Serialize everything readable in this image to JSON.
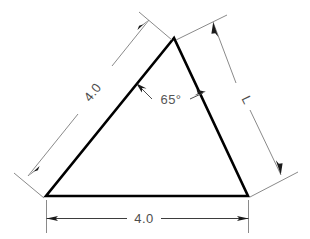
{
  "drawing": {
    "title": "Triangle with dimensions",
    "background_color": "#ffffff",
    "shape_color": "#000000",
    "dimension_line_color": "#7a7a7a",
    "text_color": "#4d4d4d",
    "shape": {
      "type": "triangle",
      "vertices": [
        {
          "name": "apex",
          "x": 174,
          "y": 38
        },
        {
          "name": "bottom-left",
          "x": 46,
          "y": 196
        },
        {
          "name": "bottom-right",
          "x": 248,
          "y": 196
        }
      ]
    },
    "dimensions": [
      {
        "id": "bottom",
        "label": "4.0",
        "orientation": "horizontal",
        "position": "below-base",
        "measures": "base"
      },
      {
        "id": "left-side",
        "label": "4.0",
        "orientation": "diagonal",
        "position": "outside-left",
        "measures": "left-side"
      },
      {
        "id": "right-side",
        "label": "L",
        "orientation": "diagonal",
        "position": "outside-right",
        "measures": "right-side"
      }
    ],
    "angles": [
      {
        "id": "apex-angle",
        "label": "65°",
        "vertex": "apex"
      }
    ]
  }
}
